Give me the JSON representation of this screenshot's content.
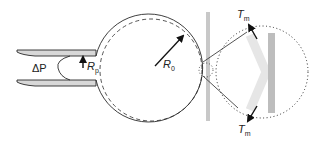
{
  "diagram": {
    "labels": {
      "pressure": "ΔP",
      "pipette_radius_symbol": "R",
      "pipette_radius_sub": "p",
      "cell_radius_symbol": "R",
      "cell_radius_sub": "0",
      "tension_top_symbol": "T",
      "tension_top_sub": "m",
      "tension_bottom_symbol": "T",
      "tension_bottom_sub": "m"
    },
    "colors": {
      "stroke": "#2a2a2a",
      "pipette_fill": "#d8d8d8",
      "wall_bar": "#c8c8c8",
      "membrane_band": "#e6e6e6",
      "dark_bar": "#bdbdbd"
    }
  }
}
